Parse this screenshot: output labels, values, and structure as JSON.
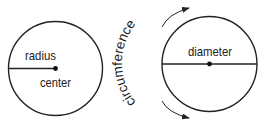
{
  "diagram": {
    "left_circle": {
      "labels": {
        "radius": "radius",
        "center": "center"
      }
    },
    "right_circle": {
      "labels": {
        "diameter": "diameter",
        "circumference": "circumference"
      }
    },
    "colors": {
      "stroke": "#222222",
      "background": "#ffffff"
    }
  }
}
